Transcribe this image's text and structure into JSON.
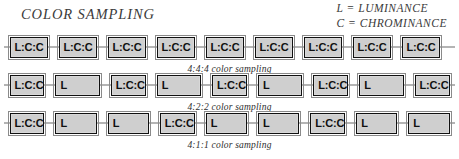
{
  "header": {
    "title": "COLOR SAMPLING",
    "legend": [
      "L = LUMINANCE",
      "C = CHROMINANCE"
    ]
  },
  "colors": {
    "cell_fill": "#cfcfcf",
    "cell_border": "#111111",
    "cell_outline": "#8a8a8a",
    "wire": "#6b6b6b",
    "text": "#3a3a3a",
    "background": "#ffffff"
  },
  "diagram": {
    "type": "chroma-subsampling-schematic",
    "rows": [
      {
        "id": "row-444",
        "caption": "4:4:4 color sampling",
        "cells": [
          {
            "label": "L:C:C",
            "kind": "lcc"
          },
          {
            "label": "L:C:C",
            "kind": "lcc"
          },
          {
            "label": "L:C:C",
            "kind": "lcc"
          },
          {
            "label": "L:C:C",
            "kind": "lcc"
          },
          {
            "label": "L:C:C",
            "kind": "lcc"
          },
          {
            "label": "L:C:C",
            "kind": "lcc"
          },
          {
            "label": "L:C:C",
            "kind": "lcc"
          },
          {
            "label": "L:C:C",
            "kind": "lcc"
          },
          {
            "label": "L:C:C",
            "kind": "lcc"
          }
        ]
      },
      {
        "id": "row-422",
        "caption": "4:2:2 color sampling",
        "cells": [
          {
            "label": "L:C:C",
            "kind": "lcc"
          },
          {
            "label": "L",
            "kind": "lum"
          },
          {
            "label": "L:C:C",
            "kind": "lcc"
          },
          {
            "label": "L",
            "kind": "lum"
          },
          {
            "label": "L:C:C",
            "kind": "lcc"
          },
          {
            "label": "L",
            "kind": "lum"
          },
          {
            "label": "L:C:C",
            "kind": "lcc"
          },
          {
            "label": "L",
            "kind": "lum"
          },
          {
            "label": "L:C:C",
            "kind": "lcc"
          }
        ]
      },
      {
        "id": "row-411",
        "caption": "4:1:1 color sampling",
        "cells": [
          {
            "label": "L:C:C",
            "kind": "lcc"
          },
          {
            "label": "L",
            "kind": "lum"
          },
          {
            "label": "L",
            "kind": "lum"
          },
          {
            "label": "L:C:C",
            "kind": "lcc"
          },
          {
            "label": "L",
            "kind": "lum"
          },
          {
            "label": "L",
            "kind": "lum"
          },
          {
            "label": "L:C:C",
            "kind": "lcc"
          },
          {
            "label": "L",
            "kind": "lum"
          },
          {
            "label": "L",
            "kind": "lum"
          }
        ]
      }
    ]
  }
}
